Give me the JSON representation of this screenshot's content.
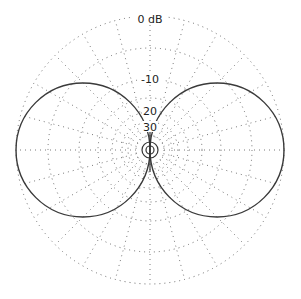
{
  "chart_data": {
    "type": "polar",
    "title": "",
    "radial_axis": {
      "unit": "dB",
      "tick_labels": [
        "0 dB",
        "-10",
        "20",
        "30"
      ],
      "ticks_db": [
        0,
        -10,
        -20,
        -30
      ],
      "range_db": [
        -40,
        0
      ]
    },
    "angular_grid_step_deg": 15,
    "grid": true,
    "series": [
      {
        "name": "figure-8 pattern",
        "pattern": "bidirectional (dipole)",
        "angles_deg": [
          0,
          15,
          30,
          45,
          60,
          75,
          90,
          105,
          120,
          135,
          150,
          165,
          180,
          195,
          210,
          225,
          240,
          255,
          270,
          285,
          300,
          315,
          330,
          345
        ],
        "gain_db": [
          -40,
          -12,
          -6,
          -3,
          -1.2,
          -0.3,
          0,
          -0.3,
          -1.2,
          -3,
          -6,
          -12,
          -40,
          -12,
          -6,
          -3,
          -1.2,
          -0.3,
          0,
          -0.3,
          -1.2,
          -3,
          -6,
          -12
        ]
      }
    ],
    "legend": null
  },
  "labels": {
    "zero_db": "0 dB",
    "minus10": "-10",
    "minus20": "20",
    "minus30": "30"
  }
}
